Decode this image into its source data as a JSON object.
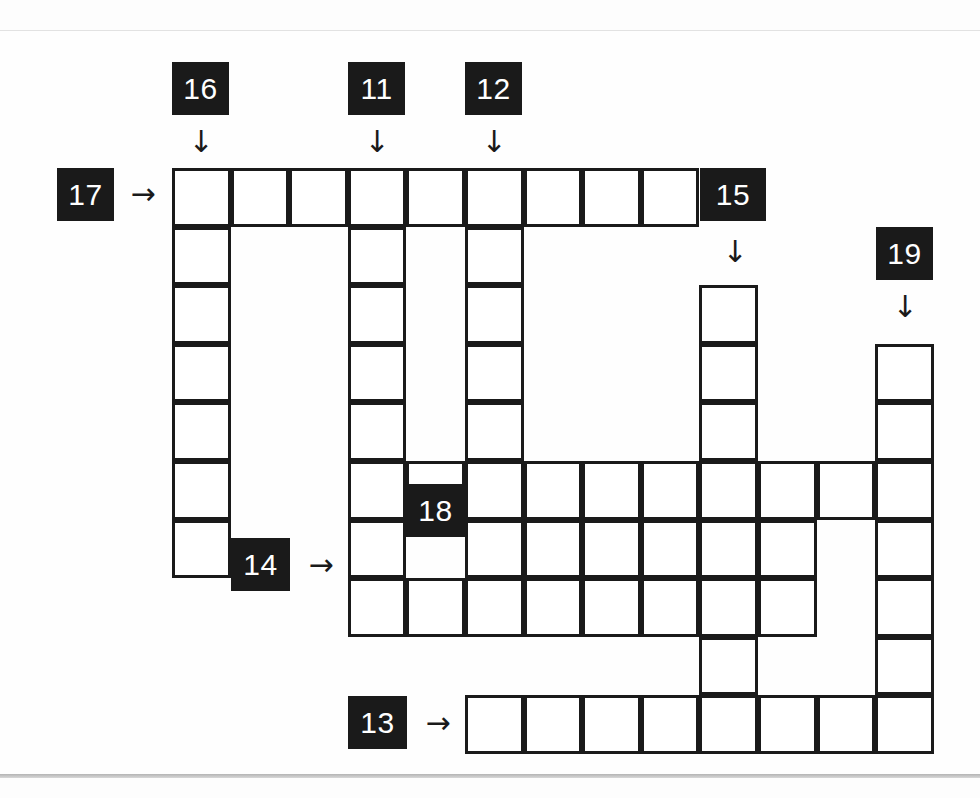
{
  "page": {
    "width": 980,
    "height": 798,
    "background": "#fdfdfd",
    "ink_color": "#1a1a1a",
    "cell_fill": "#ffffff",
    "clue_box_fill": "#1a1a1a",
    "clue_box_text_color": "#ffffff",
    "rule_color": "#b4b4b4"
  },
  "grid": {
    "origin_x": 172,
    "origin_y": 168,
    "cell_size": 58.6,
    "columns": 13,
    "rows": 10,
    "border_width": 3
  },
  "clue_markers": [
    {
      "id": "marker-16",
      "label": "16",
      "x": 172,
      "y": 62,
      "w": 57,
      "h": 53,
      "direction": "down",
      "arrow": "↓",
      "arrow_x": 188,
      "arrow_y": 122
    },
    {
      "id": "marker-11",
      "label": "11",
      "x": 348,
      "y": 62,
      "w": 57,
      "h": 53,
      "direction": "down",
      "arrow": "↓",
      "arrow_x": 364,
      "arrow_y": 122
    },
    {
      "id": "marker-12",
      "label": "12",
      "x": 465,
      "y": 62,
      "w": 57,
      "h": 53,
      "direction": "down",
      "arrow": "↓",
      "arrow_x": 481,
      "arrow_y": 122
    },
    {
      "id": "marker-17",
      "label": "17",
      "x": 57,
      "y": 168,
      "w": 57,
      "h": 53,
      "direction": "across",
      "arrow": "→",
      "arrow_x": 122,
      "arrow_y": 181
    },
    {
      "id": "marker-15",
      "label": "15",
      "x": 700,
      "y": 168,
      "w": 66,
      "h": 53,
      "direction": "down",
      "arrow": "↓",
      "arrow_x": 722,
      "arrow_y": 232
    },
    {
      "id": "marker-19",
      "label": "19",
      "x": 876,
      "y": 227,
      "w": 57,
      "h": 53,
      "direction": "down",
      "arrow": "↓",
      "arrow_x": 892,
      "arrow_y": 287
    },
    {
      "id": "marker-18",
      "label": "18",
      "x": 406,
      "y": 484,
      "w": 59,
      "h": 53,
      "direction": "down",
      "arrow": null,
      "arrow_x": null,
      "arrow_y": null
    },
    {
      "id": "marker-14",
      "label": "14",
      "x": 231,
      "y": 538,
      "w": 59,
      "h": 53,
      "direction": "across",
      "arrow": "→",
      "arrow_x": 300,
      "arrow_y": 552
    },
    {
      "id": "marker-13",
      "label": "13",
      "x": 348,
      "y": 696,
      "w": 59,
      "h": 53,
      "direction": "across",
      "arrow": "→",
      "arrow_x": 417,
      "arrow_y": 710
    }
  ],
  "entries": [
    {
      "id": "entry-17-across",
      "clue_number": "17",
      "direction": "across",
      "row": 1,
      "col_start": 1,
      "length": 9
    },
    {
      "id": "entry-16-down",
      "clue_number": "16",
      "direction": "down",
      "col": 1,
      "row_start": 1,
      "length": 7
    },
    {
      "id": "entry-11-down",
      "clue_number": "11",
      "direction": "down",
      "col": 4,
      "row_start": 1,
      "length": 7
    },
    {
      "id": "entry-12-down",
      "clue_number": "12",
      "direction": "down",
      "col": 6,
      "row_start": 1,
      "length": 7
    },
    {
      "id": "entry-15-down",
      "clue_number": "15",
      "direction": "down",
      "col": 10,
      "row_start": 3,
      "length": 7
    },
    {
      "id": "entry-19-down",
      "clue_number": "19",
      "direction": "down",
      "col": 13,
      "row_start": 4,
      "length": 7
    },
    {
      "id": "entry-row6-across",
      "clue_number": "",
      "direction": "across",
      "row": 6,
      "col_start": 4,
      "length": 10
    },
    {
      "id": "entry-18-across",
      "clue_number": "18",
      "direction": "across",
      "row": 7,
      "col_start": 6,
      "length": 7
    },
    {
      "id": "entry-14-across",
      "clue_number": "14",
      "direction": "across",
      "row": 8,
      "col_start": 4,
      "length": 8
    },
    {
      "id": "entry-13-across",
      "clue_number": "13",
      "direction": "across",
      "row": 10,
      "col_start": 6,
      "length": 8
    }
  ],
  "cells": [
    {
      "row": 1,
      "col": 1
    },
    {
      "row": 1,
      "col": 2
    },
    {
      "row": 1,
      "col": 3
    },
    {
      "row": 1,
      "col": 4
    },
    {
      "row": 1,
      "col": 5
    },
    {
      "row": 1,
      "col": 6
    },
    {
      "row": 1,
      "col": 7
    },
    {
      "row": 1,
      "col": 8
    },
    {
      "row": 1,
      "col": 9
    },
    {
      "row": 2,
      "col": 1
    },
    {
      "row": 2,
      "col": 4
    },
    {
      "row": 2,
      "col": 6
    },
    {
      "row": 3,
      "col": 1
    },
    {
      "row": 3,
      "col": 4
    },
    {
      "row": 3,
      "col": 6
    },
    {
      "row": 3,
      "col": 10
    },
    {
      "row": 4,
      "col": 1
    },
    {
      "row": 4,
      "col": 4
    },
    {
      "row": 4,
      "col": 6
    },
    {
      "row": 4,
      "col": 10
    },
    {
      "row": 4,
      "col": 13
    },
    {
      "row": 5,
      "col": 1
    },
    {
      "row": 5,
      "col": 4
    },
    {
      "row": 5,
      "col": 6
    },
    {
      "row": 5,
      "col": 10
    },
    {
      "row": 5,
      "col": 13
    },
    {
      "row": 6,
      "col": 1
    },
    {
      "row": 6,
      "col": 4
    },
    {
      "row": 6,
      "col": 5
    },
    {
      "row": 6,
      "col": 6
    },
    {
      "row": 6,
      "col": 7
    },
    {
      "row": 6,
      "col": 8
    },
    {
      "row": 6,
      "col": 9
    },
    {
      "row": 6,
      "col": 10
    },
    {
      "row": 6,
      "col": 11
    },
    {
      "row": 6,
      "col": 12
    },
    {
      "row": 6,
      "col": 13
    },
    {
      "row": 7,
      "col": 1
    },
    {
      "row": 7,
      "col": 4
    },
    {
      "row": 7,
      "col": 6
    },
    {
      "row": 7,
      "col": 7
    },
    {
      "row": 7,
      "col": 8
    },
    {
      "row": 7,
      "col": 9
    },
    {
      "row": 7,
      "col": 10
    },
    {
      "row": 7,
      "col": 11
    },
    {
      "row": 7,
      "col": 13
    },
    {
      "row": 8,
      "col": 4
    },
    {
      "row": 8,
      "col": 5
    },
    {
      "row": 8,
      "col": 6
    },
    {
      "row": 8,
      "col": 7
    },
    {
      "row": 8,
      "col": 8
    },
    {
      "row": 8,
      "col": 9
    },
    {
      "row": 8,
      "col": 10
    },
    {
      "row": 8,
      "col": 11
    },
    {
      "row": 8,
      "col": 13
    },
    {
      "row": 9,
      "col": 10
    },
    {
      "row": 9,
      "col": 13
    },
    {
      "row": 10,
      "col": 6
    },
    {
      "row": 10,
      "col": 7
    },
    {
      "row": 10,
      "col": 8
    },
    {
      "row": 10,
      "col": 9
    },
    {
      "row": 10,
      "col": 10
    },
    {
      "row": 10,
      "col": 11
    },
    {
      "row": 10,
      "col": 12
    },
    {
      "row": 10,
      "col": 13
    }
  ]
}
